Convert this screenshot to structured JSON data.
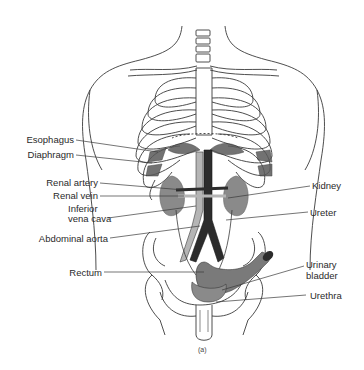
{
  "figure": {
    "caption": "(a)"
  },
  "labels_left": [
    {
      "id": "esophagus",
      "text": "Esophagus"
    },
    {
      "id": "diaphragm",
      "text": "Diaphragm"
    },
    {
      "id": "renal-artery",
      "text": "Renal artery"
    },
    {
      "id": "renal-vein",
      "text": "Renal vein"
    },
    {
      "id": "inferior-vena-cava-1",
      "text": "Inferior"
    },
    {
      "id": "inferior-vena-cava-2",
      "text": "vena cava"
    },
    {
      "id": "abdominal-aorta",
      "text": "Abdominal aorta"
    },
    {
      "id": "rectum",
      "text": "Rectum"
    }
  ],
  "labels_right": [
    {
      "id": "kidney",
      "text": "Kidney"
    },
    {
      "id": "ureter",
      "text": "Ureter"
    },
    {
      "id": "urinary-bladder-1",
      "text": "Urinary"
    },
    {
      "id": "urinary-bladder-2",
      "text": "bladder"
    },
    {
      "id": "urethra",
      "text": "Urethra"
    }
  ],
  "colors": {
    "line": "#3a3a3a",
    "organ_gray": "#8a8a8a",
    "vessel_dark": "#2c2c2c",
    "vessel_light": "#b5b5b5",
    "text": "#2a2a2a"
  }
}
